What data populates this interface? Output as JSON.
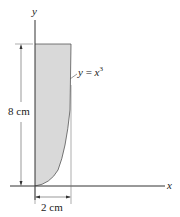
{
  "figure": {
    "y_axis_label": "y",
    "x_axis_label": "x",
    "curve_label_lhs": "y",
    "curve_label_eq": " = ",
    "curve_label_rhs": "x",
    "curve_label_exp": "3",
    "height_dimension": "8 cm",
    "width_dimension": "2 cm",
    "region_fill_color": "#d9d9d9",
    "line_color": "#333333"
  }
}
